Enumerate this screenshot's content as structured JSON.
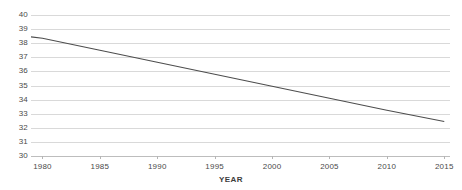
{
  "chart_data": {
    "type": "line",
    "title": "",
    "xlabel": "YEAR",
    "ylabel": "",
    "grid": true,
    "legend": false,
    "legend_position": "none",
    "xlim": [
      1979,
      2015.5
    ],
    "ylim": [
      30,
      40
    ],
    "x_tick_labels": [
      "1980",
      "1985",
      "1990",
      "1995",
      "2000",
      "2005",
      "2010",
      "2015"
    ],
    "x_ticks": [
      1980,
      1985,
      1990,
      1995,
      2000,
      2005,
      2010,
      2015
    ],
    "y_tick_labels": [
      "40",
      "39",
      "38",
      "37",
      "36",
      "35",
      "34",
      "33",
      "32",
      "31",
      "30"
    ],
    "y_ticks": [
      40,
      39,
      38,
      37,
      36,
      35,
      34,
      33,
      32,
      31,
      30
    ],
    "series": [
      {
        "name": "trend",
        "color": "#4d4d4d",
        "x": [
          1979,
          1980,
          1985,
          1990,
          1995,
          2000,
          2005,
          2010,
          2015
        ],
        "values": [
          38.45,
          38.35,
          37.5,
          36.65,
          35.8,
          34.95,
          34.1,
          33.25,
          32.45
        ]
      }
    ],
    "colors": {
      "line": "#4d4d4d",
      "gridline": "#d9d9d9",
      "axis": "#bdbdbd",
      "tick_text": "#4a4a4a",
      "axis_title": "#3d3d3d",
      "background": "#ffffff"
    }
  }
}
